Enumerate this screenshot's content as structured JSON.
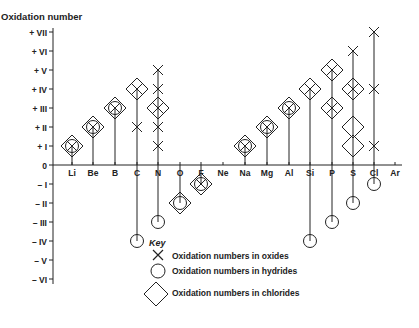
{
  "chart_data": {
    "type": "scatter",
    "title": "",
    "ylabel": "Oxidation number",
    "xlabel": "",
    "ylim": [
      -6,
      7
    ],
    "y_ticks": [
      "+ VII",
      "+ VI",
      "+ V",
      "+ IV",
      "+ III",
      "+ II",
      "+ I",
      "0",
      "– I",
      "– II",
      "– III",
      "– IV",
      "– V",
      "– VI"
    ],
    "y_tick_values": [
      7,
      6,
      5,
      4,
      3,
      2,
      1,
      0,
      -1,
      -2,
      -3,
      -4,
      -5,
      -6
    ],
    "categories": [
      "Li",
      "Be",
      "B",
      "C",
      "N",
      "O",
      "F",
      "Ne",
      "Na",
      "Mg",
      "Al",
      "Si",
      "P",
      "S",
      "Cl",
      "Ar"
    ],
    "series": [
      {
        "name": "Oxidation numbers in oxides",
        "marker": "cross",
        "points": {
          "Li": [
            1
          ],
          "Be": [
            2
          ],
          "B": [
            3
          ],
          "C": [
            2,
            4
          ],
          "N": [
            1,
            2,
            3,
            4,
            5
          ],
          "F": [
            -1
          ],
          "Na": [
            1
          ],
          "Mg": [
            2
          ],
          "Al": [
            3
          ],
          "Si": [
            4
          ],
          "P": [
            3,
            5
          ],
          "S": [
            4,
            6
          ],
          "Cl": [
            1,
            4,
            7
          ]
        }
      },
      {
        "name": "Oxidation numbers in hydrides",
        "marker": "circle",
        "points": {
          "Li": [
            1
          ],
          "Be": [
            2
          ],
          "B": [
            3
          ],
          "C": [
            -4
          ],
          "N": [
            -3
          ],
          "O": [
            -2
          ],
          "F": [
            -1
          ],
          "Na": [
            1
          ],
          "Mg": [
            2
          ],
          "Al": [
            3
          ],
          "Si": [
            -4
          ],
          "P": [
            -3
          ],
          "S": [
            -2
          ],
          "Cl": [
            -1
          ]
        }
      },
      {
        "name": "Oxidation numbers in chlorides",
        "marker": "diamond",
        "points": {
          "Li": [
            1
          ],
          "Be": [
            2
          ],
          "B": [
            3
          ],
          "C": [
            4
          ],
          "N": [
            3
          ],
          "O": [
            -2
          ],
          "F": [
            -1
          ],
          "Na": [
            1
          ],
          "Mg": [
            2
          ],
          "Al": [
            3
          ],
          "Si": [
            4
          ],
          "P": [
            3,
            5
          ],
          "S": [
            1,
            2,
            4
          ]
        }
      }
    ],
    "legend": {
      "title": "Key",
      "position": "bottom-center",
      "entries": [
        "Oxidation numbers in oxides",
        "Oxidation numbers in hydrides",
        "Oxidation numbers in chlorides"
      ]
    },
    "grid": false
  }
}
